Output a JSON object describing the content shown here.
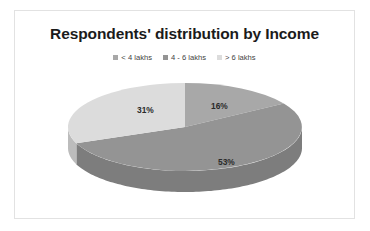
{
  "card": {
    "border_color": "#e2e2e2",
    "background": "#ffffff"
  },
  "title": "Respondents' distribution by Income",
  "legend": {
    "position": "top",
    "items": [
      {
        "label": "< 4 lakhs",
        "color": "#a8a8a8",
        "swatch_icon": "square-swatch-icon"
      },
      {
        "label": "4 - 6 lakhs",
        "color": "#949494",
        "swatch_icon": "square-swatch-icon"
      },
      {
        "label": "> 6 lakhs",
        "color": "#dcdcdc",
        "swatch_icon": "square-swatch-icon"
      }
    ]
  },
  "labels": {
    "slice_1": "16%",
    "slice_2": "53%",
    "slice_3": "31%"
  },
  "chart_data": {
    "type": "pie",
    "title": "Respondents' distribution by Income",
    "subtitle": "",
    "xlabel": "",
    "ylabel": "",
    "categories": [
      "< 4 lakhs",
      "4 - 6 lakhs",
      "> 6 lakhs"
    ],
    "values": [
      16,
      53,
      31
    ],
    "value_unit": "percent",
    "data_labels": [
      "16%",
      "53%",
      "31%"
    ],
    "colors": [
      "#a8a8a8",
      "#949494",
      "#dcdcdc"
    ],
    "side_colors": [
      "#8f8f8f",
      "#7d7d7d",
      "#bcbcbc"
    ],
    "start_angle_deg": 0,
    "direction": "clockwise",
    "three_d": true,
    "grid": false,
    "legend_position": "top"
  }
}
